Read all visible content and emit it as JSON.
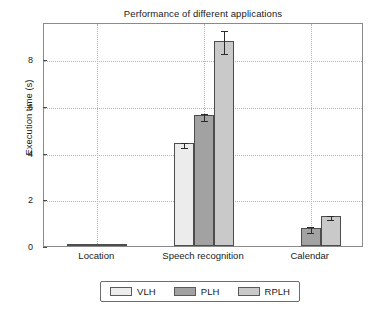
{
  "chart_data": {
    "type": "bar",
    "title": "Performance of different applications",
    "xlabel": "",
    "ylabel": "Execution time (s)",
    "categories": [
      "Location",
      "Speech recognition",
      "Calendar"
    ],
    "series": [
      {
        "name": "VLH",
        "color": "#ececec",
        "values": [
          0.03,
          4.4,
          0.0
        ],
        "errors": [
          0.01,
          0.12,
          0.0
        ]
      },
      {
        "name": "PLH",
        "color": "#a2a2a2",
        "values": [
          0.03,
          5.6,
          0.78
        ],
        "errors": [
          0.01,
          0.14,
          0.14
        ]
      },
      {
        "name": "RPLH",
        "color": "#c9c9c9",
        "values": [
          0.03,
          8.8,
          1.27
        ],
        "errors": [
          0.01,
          0.5,
          0.09
        ]
      }
    ],
    "yticks": [
      0,
      2,
      4,
      6,
      8
    ],
    "ytick_labels": [
      "0",
      "2",
      "4",
      "6",
      "8"
    ],
    "ylim": [
      0,
      9.6
    ],
    "grid": true,
    "grid_style": "dotted",
    "legend_position": "below-axes",
    "legend_entries": [
      "VLH",
      "PLH",
      "RPLH"
    ]
  },
  "axes": {
    "frame_color": "#8a8a8a",
    "tick_color": "#4a4a4a",
    "grid_color": "#b5b5b5"
  }
}
